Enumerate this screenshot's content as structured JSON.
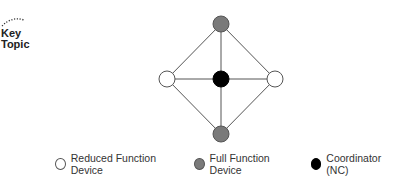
{
  "badge": {
    "line1": "Key",
    "line2": "Topic"
  },
  "diagram": {
    "type": "star-mesh-topology",
    "nodes": [
      {
        "id": "top",
        "role": "full",
        "x": 221,
        "y": 24
      },
      {
        "id": "left",
        "role": "reduced",
        "x": 167,
        "y": 79
      },
      {
        "id": "center",
        "role": "coordinator",
        "x": 221,
        "y": 79
      },
      {
        "id": "right",
        "role": "reduced",
        "x": 275,
        "y": 79
      },
      {
        "id": "bottom",
        "role": "full",
        "x": 221,
        "y": 134
      }
    ],
    "edges": [
      [
        "top",
        "left"
      ],
      [
        "top",
        "center"
      ],
      [
        "top",
        "right"
      ],
      [
        "left",
        "center"
      ],
      [
        "center",
        "right"
      ],
      [
        "left",
        "bottom"
      ],
      [
        "center",
        "bottom"
      ],
      [
        "right",
        "bottom"
      ]
    ],
    "colors": {
      "reduced": "#ffffff",
      "full": "#7a7a7a",
      "coordinator": "#000000",
      "edge": "#555555"
    }
  },
  "legend": {
    "items": [
      {
        "label": "Reduced Function Device",
        "color": "#ffffff"
      },
      {
        "label": "Full Function Device",
        "color": "#7a7a7a"
      },
      {
        "label": "Coordinator (NC)",
        "color": "#000000"
      }
    ]
  }
}
